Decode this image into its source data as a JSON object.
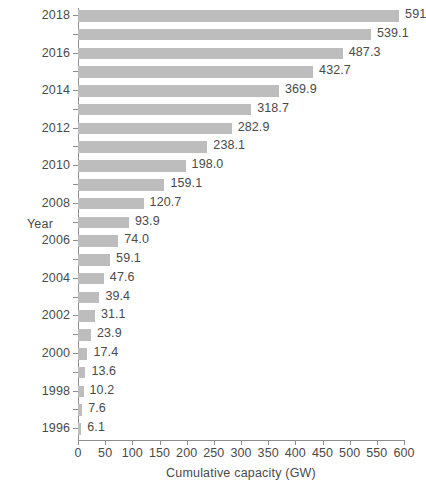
{
  "chart_data": {
    "type": "bar",
    "orientation": "horizontal",
    "title": "",
    "xlabel": "Cumulative capacity (GW)",
    "ylabel": "Year",
    "xlim": [
      0,
      600
    ],
    "xticks": [
      0,
      50,
      100,
      150,
      200,
      250,
      300,
      350,
      400,
      450,
      500,
      550,
      600
    ],
    "xtick_labels": [
      "0",
      "50",
      "100",
      "150",
      "200",
      "250",
      "300",
      "350",
      "400",
      "450",
      "500",
      "550",
      "600"
    ],
    "grid": false,
    "legend": null,
    "bar_color": "#bdbdbd",
    "axis_color": "#8e8e8e",
    "text_color": "#4a4a4a",
    "categories": [
      "2018",
      "2017",
      "2016",
      "2015",
      "2014",
      "2013",
      "2012",
      "2011",
      "2010",
      "2009",
      "2008",
      "2007",
      "2006",
      "2005",
      "2004",
      "2003",
      "2002",
      "2001",
      "2000",
      "1999",
      "1998",
      "1997",
      "1996"
    ],
    "values": [
      591,
      539.1,
      487.3,
      432.7,
      369.9,
      318.7,
      282.9,
      238.1,
      198.0,
      159.1,
      120.7,
      93.9,
      74.0,
      59.1,
      47.6,
      39.4,
      31.1,
      23.9,
      17.4,
      13.6,
      10.2,
      7.6,
      6.1
    ],
    "value_labels": [
      "591",
      "539.1",
      "487.3",
      "432.7",
      "369.9",
      "318.7",
      "282.9",
      "238.1",
      "198.0",
      "159.1",
      "120.7",
      "93.9",
      "74.0",
      "59.1",
      "47.6",
      "39.4",
      "31.1",
      "23.9",
      "17.4",
      "13.6",
      "10.2",
      "7.6",
      "6.1"
    ],
    "ytick_labels_shown": [
      "2018",
      "2016",
      "2014",
      "2012",
      "2010",
      "2008",
      "2006",
      "2004",
      "2002",
      "2000",
      "1998",
      "1996"
    ]
  }
}
